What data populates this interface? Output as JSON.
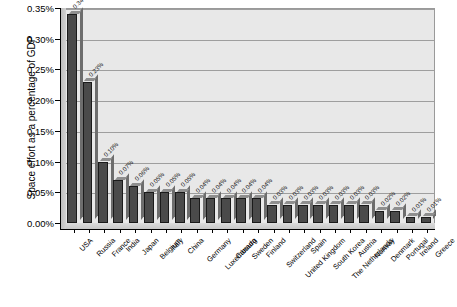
{
  "chart_data": {
    "type": "bar",
    "title": "",
    "xlabel": "",
    "ylabel": "Space effort as a percentage of GDP",
    "ylim": [
      0,
      0.0035
    ],
    "ytick_labels": [
      "0.00%",
      "0.05%",
      "0.10%",
      "0.15%",
      "0.20%",
      "0.25%",
      "0.30%",
      "0.35%"
    ],
    "ytick_values": [
      0.0,
      0.0005,
      0.001,
      0.0015,
      0.002,
      0.0025,
      0.003,
      0.0035
    ],
    "grid": true,
    "legend": "none",
    "categories": [
      "USA",
      "Russia",
      "France",
      "India",
      "Japan",
      "Belgium",
      "Italy",
      "China",
      "Germany",
      "Luxembourg",
      "Canada",
      "Sweden",
      "Finland",
      "Switzerland",
      "United Kingdom",
      "Spain",
      "South Korea",
      "The Netherlands",
      "Austria",
      "Norway",
      "Denmark",
      "Portugal",
      "Ireland",
      "Greece"
    ],
    "values": [
      0.34,
      0.23,
      0.1,
      0.07,
      0.06,
      0.05,
      0.05,
      0.05,
      0.04,
      0.04,
      0.04,
      0.04,
      0.04,
      0.03,
      0.03,
      0.03,
      0.03,
      0.03,
      0.03,
      0.03,
      0.02,
      0.02,
      0.01,
      0.01
    ],
    "value_labels": [
      "0.34%",
      "0.23%",
      "0.10%",
      "0.07%",
      "0.06%",
      "0.05%",
      "0.05%",
      "0.05%",
      "0.04%",
      "0.04%",
      "0.04%",
      "0.04%",
      "0.04%",
      "0.03%",
      "0.03%",
      "0.03%",
      "0.03%",
      "0.03%",
      "0.03%",
      "0.03%",
      "0.02%",
      "0.02%",
      "0.01%",
      "0.01%"
    ],
    "bar_color": "#4a4a4a",
    "plot_background": "#e8e8e8",
    "gridline_color": "#9e9e9e"
  }
}
